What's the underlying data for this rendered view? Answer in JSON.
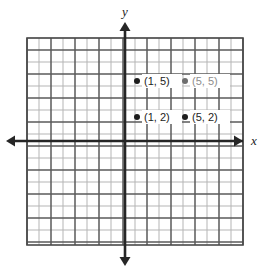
{
  "figure": {
    "title": "",
    "background_color": "#ffffff"
  },
  "axes": {
    "x_label": "x",
    "y_label": "y",
    "axis_color": "#262626",
    "origin_px": {
      "x": 125,
      "y": 141
    },
    "unit_px": 12,
    "x_range": [
      -8,
      10
    ],
    "y_range": [
      -8,
      9
    ],
    "arrows": [
      "left",
      "right",
      "up",
      "down"
    ]
  },
  "grid": {
    "minor_color": "#b5b5b5",
    "major_color": "#5a5a5a",
    "border_color": "#4a4a4a",
    "minor_step_units": 1,
    "major_step_units": 2,
    "left_px": 27,
    "top_px": 38,
    "right_px": 243,
    "bottom_px": 245,
    "columns": 18,
    "rows": 17
  },
  "chart_data": {
    "type": "scatter",
    "title": "",
    "xlabel": "x",
    "ylabel": "y",
    "xlim": [
      -8,
      10
    ],
    "ylim": [
      -8,
      9
    ],
    "grid": true,
    "legend": null,
    "points": [
      {
        "name": "point-1-5",
        "x": 1,
        "y": 5,
        "label": "(1, 5)",
        "marker": "filled-circle",
        "marker_color": "#1d1d1d",
        "label_color": "#1d1d1d",
        "label_side": "right"
      },
      {
        "name": "point-5-5",
        "x": 5,
        "y": 5,
        "label": "(5, 5)",
        "marker": "filled-circle",
        "marker_color": "#6e6e6e",
        "label_color": "#8d8d8d",
        "label_side": "right"
      },
      {
        "name": "point-1-2",
        "x": 1,
        "y": 2,
        "label": "(1, 2)",
        "marker": "filled-circle",
        "marker_color": "#1d1d1d",
        "label_color": "#1d1d1d",
        "label_side": "right"
      },
      {
        "name": "point-5-2",
        "x": 5,
        "y": 2,
        "label": "(5, 2)",
        "marker": "filled-circle",
        "marker_color": "#1d1d1d",
        "label_color": "#1d1d1d",
        "label_side": "right"
      }
    ]
  }
}
